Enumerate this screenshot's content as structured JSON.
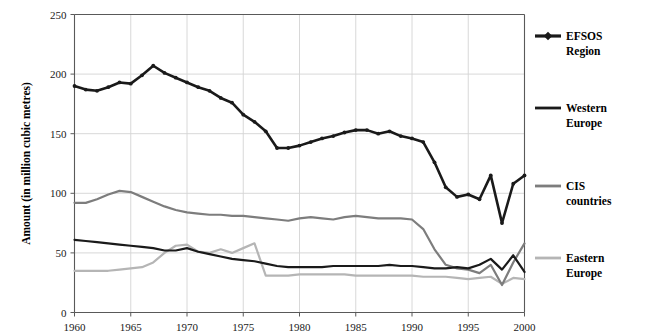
{
  "chart_data": {
    "type": "line",
    "title": "",
    "xlabel": "",
    "ylabel": "Amount (in million cubic metres)",
    "xlim": [
      1960,
      2000
    ],
    "ylim": [
      0,
      250
    ],
    "ytick_values": [
      0,
      50,
      100,
      150,
      200,
      250
    ],
    "ytick_labels": [
      "0",
      "50",
      "100",
      "150",
      "200",
      "250"
    ],
    "xtick_values": [
      1960,
      1965,
      1970,
      1975,
      1980,
      1985,
      1990,
      1995,
      2000
    ],
    "xtick_labels": [
      "1960",
      "1965",
      "1970",
      "1975",
      "1980",
      "1985",
      "1990",
      "1995",
      "2000"
    ],
    "grid": "horizontal-and-vertical-major",
    "legend_position": "right",
    "x": [
      1960,
      1961,
      1962,
      1963,
      1964,
      1965,
      1966,
      1967,
      1968,
      1969,
      1970,
      1971,
      1972,
      1973,
      1974,
      1975,
      1976,
      1977,
      1978,
      1979,
      1980,
      1981,
      1982,
      1983,
      1984,
      1985,
      1986,
      1987,
      1988,
      1989,
      1990,
      1991,
      1992,
      1993,
      1994,
      1995,
      1996,
      1997,
      1998,
      1999,
      2000
    ],
    "series": [
      {
        "name": "EFSOS Region",
        "color": "#1a1a1a",
        "width": 2.6,
        "markers": true,
        "values": [
          190,
          187,
          186,
          189,
          193,
          192,
          199,
          207,
          201,
          197,
          193,
          189,
          186,
          180,
          176,
          166,
          160,
          152,
          138,
          138,
          140,
          143,
          146,
          148,
          151,
          153,
          153,
          150,
          152,
          148,
          146,
          143,
          126,
          105,
          97,
          99,
          95,
          115,
          75,
          108,
          115
        ]
      },
      {
        "name": "Western Europe",
        "color": "#1a1a1a",
        "width": 2.2,
        "markers": false,
        "values": [
          61,
          60,
          59,
          58,
          57,
          56,
          55,
          54,
          52,
          52,
          54,
          51,
          49,
          47,
          45,
          44,
          43,
          41,
          39,
          38,
          38,
          38,
          38,
          39,
          39,
          39,
          39,
          39,
          40,
          39,
          39,
          38,
          37,
          37,
          38,
          37,
          40,
          45,
          36,
          48,
          34
        ]
      },
      {
        "name": "CIS countries",
        "color": "#7d7d7d",
        "width": 2.2,
        "markers": false,
        "values": [
          92,
          92,
          95,
          99,
          102,
          101,
          97,
          93,
          89,
          86,
          84,
          83,
          82,
          82,
          81,
          81,
          80,
          79,
          78,
          77,
          79,
          80,
          79,
          78,
          80,
          81,
          80,
          79,
          79,
          79,
          78,
          70,
          53,
          40,
          37,
          36,
          33,
          40,
          23,
          42,
          58
        ]
      },
      {
        "name": "Eastern Europe",
        "color": "#b5b5b5",
        "width": 2.2,
        "markers": false,
        "values": [
          35,
          35,
          35,
          35,
          36,
          37,
          38,
          42,
          50,
          56,
          57,
          51,
          50,
          53,
          50,
          54,
          58,
          31,
          31,
          31,
          32,
          32,
          32,
          32,
          32,
          31,
          31,
          31,
          31,
          31,
          31,
          30,
          30,
          30,
          29,
          28,
          29,
          30,
          24,
          29,
          28
        ]
      }
    ]
  },
  "legend": {
    "items": [
      {
        "label_line1": "EFSOS",
        "label_line2": "Region"
      },
      {
        "label_line1": "Western",
        "label_line2": "Europe"
      },
      {
        "label_line1": "CIS",
        "label_line2": "countries"
      },
      {
        "label_line1": "Eastern",
        "label_line2": "Europe"
      }
    ]
  }
}
